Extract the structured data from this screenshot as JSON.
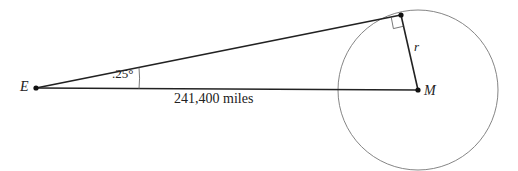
{
  "labels": {
    "earth": "E",
    "moon": "M",
    "radius": "r",
    "angle": ".25°",
    "distance": "241,400 miles"
  },
  "geometry": {
    "earth_point": [
      36,
      88
    ],
    "moon_center": [
      418,
      90
    ],
    "moon_radius": 80,
    "tangent_point": [
      401,
      15
    ],
    "angle_degrees": 0.25,
    "distance_miles": 241400
  },
  "colors": {
    "line": "#222222",
    "circle": "#777777",
    "background": "#ffffff"
  }
}
